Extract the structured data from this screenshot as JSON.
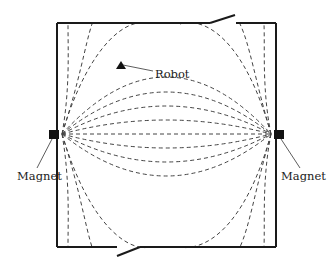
{
  "diagram": {
    "labels": {
      "robot": "Robot",
      "magnet_left": "Magnet",
      "magnet_right": "Magnet"
    },
    "colors": {
      "lines": "#1a1a1a",
      "field_lines": "#444444",
      "background": "#ffffff"
    },
    "elements": [
      "room-walls",
      "top-door",
      "bottom-door",
      "left-magnet",
      "right-magnet",
      "robot-marker",
      "magnetic-field-lines"
    ]
  }
}
